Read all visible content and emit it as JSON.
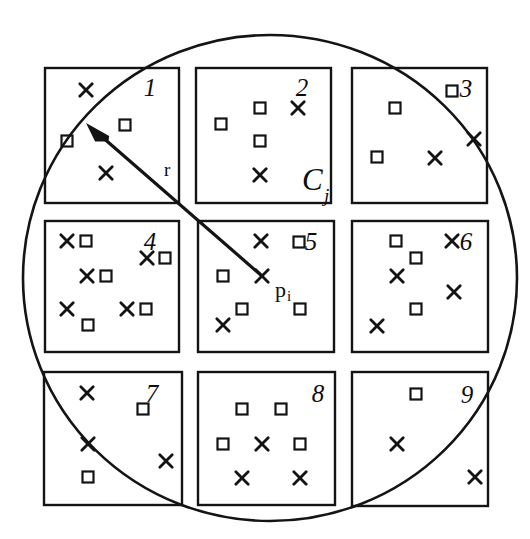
{
  "figure": {
    "background_color": "#ffffff",
    "stroke_color": "#141414",
    "width": 530,
    "height": 539
  },
  "circle": {
    "name": "query-range-circle",
    "cx": 270,
    "cy": 278,
    "rx": 247,
    "ry": 243,
    "stroke_width": 2.6
  },
  "arrow": {
    "name": "radius-arrow",
    "from_x": 262,
    "from_y": 276,
    "to_x": 86,
    "to_y": 123,
    "stroke_width": 3.2
  },
  "labels": {
    "radius": "r",
    "radius_x": 164,
    "radius_y": 176,
    "point": "p",
    "point_sub": "i",
    "point_x": 275,
    "point_y": 297,
    "cell_letter": "C",
    "cell_letter_sub": "j",
    "cell_letter_x": 302,
    "cell_letter_y": 190,
    "cell_numbers": [
      "1",
      "2",
      "3",
      "4",
      "5",
      "6",
      "7",
      "8",
      "9"
    ]
  },
  "grid": {
    "name": "cell-grid",
    "cell_size": 135,
    "gap": 18,
    "origin_x": 45,
    "origin_y": 68,
    "stroke_width": 2.4,
    "cells": [
      {
        "id": 1,
        "label": "1",
        "x": 45,
        "y": 68,
        "w": 134,
        "h": 135,
        "label_x": 150,
        "label_y": 96,
        "markers": [
          {
            "type": "cross",
            "x": 86,
            "y": 90
          },
          {
            "type": "square",
            "x": 125,
            "y": 125
          },
          {
            "type": "square",
            "x": 67,
            "y": 141
          },
          {
            "type": "cross",
            "x": 106,
            "y": 173
          }
        ]
      },
      {
        "id": 2,
        "label": "2",
        "x": 196,
        "y": 68,
        "w": 135,
        "h": 135,
        "label_x": 302,
        "label_y": 96,
        "markers": [
          {
            "type": "square",
            "x": 260,
            "y": 108
          },
          {
            "type": "cross",
            "x": 298,
            "y": 108
          },
          {
            "type": "square",
            "x": 221,
            "y": 124
          },
          {
            "type": "square",
            "x": 260,
            "y": 141
          },
          {
            "type": "cross",
            "x": 260,
            "y": 175
          }
        ]
      },
      {
        "id": 3,
        "label": "3",
        "x": 352,
        "y": 68,
        "w": 135,
        "h": 135,
        "label_x": 466,
        "label_y": 97,
        "markers": [
          {
            "type": "square",
            "x": 452,
            "y": 91
          },
          {
            "type": "square",
            "x": 395,
            "y": 108
          },
          {
            "type": "cross",
            "x": 474,
            "y": 139
          },
          {
            "type": "square",
            "x": 377,
            "y": 157
          },
          {
            "type": "cross",
            "x": 435,
            "y": 158
          }
        ]
      },
      {
        "id": 4,
        "label": "4",
        "x": 45,
        "y": 221,
        "w": 134,
        "h": 131,
        "label_x": 150,
        "label_y": 250,
        "markers": [
          {
            "type": "cross",
            "x": 67,
            "y": 241
          },
          {
            "type": "square",
            "x": 86,
            "y": 241
          },
          {
            "type": "cross",
            "x": 147,
            "y": 258
          },
          {
            "type": "square",
            "x": 165,
            "y": 258
          },
          {
            "type": "cross",
            "x": 87,
            "y": 276
          },
          {
            "type": "square",
            "x": 106,
            "y": 276
          },
          {
            "type": "cross",
            "x": 67,
            "y": 309
          },
          {
            "type": "cross",
            "x": 127,
            "y": 309
          },
          {
            "type": "square",
            "x": 146,
            "y": 309
          },
          {
            "type": "square",
            "x": 88,
            "y": 325
          }
        ]
      },
      {
        "id": 5,
        "label": "5",
        "x": 198,
        "y": 221,
        "w": 136,
        "h": 131,
        "label_x": 311,
        "label_y": 250,
        "markers": [
          {
            "type": "cross",
            "x": 261,
            "y": 241
          },
          {
            "type": "square",
            "x": 299,
            "y": 242
          },
          {
            "type": "square",
            "x": 223,
            "y": 276
          },
          {
            "type": "cross",
            "x": 262,
            "y": 276
          },
          {
            "type": "square",
            "x": 242,
            "y": 309
          },
          {
            "type": "square",
            "x": 300,
            "y": 309
          },
          {
            "type": "cross",
            "x": 223,
            "y": 325
          }
        ]
      },
      {
        "id": 6,
        "label": "6",
        "x": 352,
        "y": 221,
        "w": 136,
        "h": 131,
        "label_x": 466,
        "label_y": 250,
        "markers": [
          {
            "type": "square",
            "x": 396,
            "y": 241
          },
          {
            "type": "cross",
            "x": 452,
            "y": 241
          },
          {
            "type": "square",
            "x": 416,
            "y": 258
          },
          {
            "type": "cross",
            "x": 397,
            "y": 276
          },
          {
            "type": "cross",
            "x": 454,
            "y": 292
          },
          {
            "type": "square",
            "x": 416,
            "y": 309
          },
          {
            "type": "cross",
            "x": 377,
            "y": 326
          }
        ]
      },
      {
        "id": 7,
        "label": "7",
        "x": 44,
        "y": 372,
        "w": 138,
        "h": 133,
        "label_x": 152,
        "label_y": 402,
        "markers": [
          {
            "type": "cross",
            "x": 87,
            "y": 393
          },
          {
            "type": "square",
            "x": 143,
            "y": 409
          },
          {
            "type": "cross",
            "x": 88,
            "y": 444
          },
          {
            "type": "cross",
            "x": 166,
            "y": 461
          },
          {
            "type": "square",
            "x": 88,
            "y": 477
          }
        ]
      },
      {
        "id": 8,
        "label": "8",
        "x": 198,
        "y": 372,
        "w": 137,
        "h": 133,
        "label_x": 318,
        "label_y": 402,
        "markers": [
          {
            "type": "square",
            "x": 242,
            "y": 409
          },
          {
            "type": "square",
            "x": 281,
            "y": 409
          },
          {
            "type": "square",
            "x": 223,
            "y": 444
          },
          {
            "type": "cross",
            "x": 262,
            "y": 444
          },
          {
            "type": "square",
            "x": 300,
            "y": 444
          },
          {
            "type": "cross",
            "x": 242,
            "y": 478
          },
          {
            "type": "cross",
            "x": 300,
            "y": 478
          }
        ]
      },
      {
        "id": 9,
        "label": "9",
        "x": 352,
        "y": 372,
        "w": 136,
        "h": 134,
        "label_x": 467,
        "label_y": 403,
        "markers": [
          {
            "type": "square",
            "x": 416,
            "y": 394
          },
          {
            "type": "cross",
            "x": 397,
            "y": 444
          },
          {
            "type": "cross",
            "x": 475,
            "y": 477
          }
        ]
      }
    ]
  }
}
